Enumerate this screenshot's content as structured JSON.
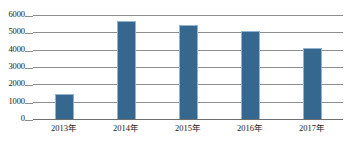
{
  "chart_data": {
    "type": "bar",
    "title": "",
    "subtitle": "",
    "xlabel": "",
    "ylabel": "",
    "categories": [
      "2013年",
      "2014年",
      "2015年",
      "2016年",
      "2017年"
    ],
    "values": [
      1450,
      5650,
      5450,
      5100,
      4100
    ],
    "ylim": [
      0,
      6000
    ],
    "ytick_labels": [
      "0",
      "1000",
      "2000",
      "3000",
      "4000",
      "5000",
      "6000"
    ],
    "ytick_values": [
      0,
      1000,
      2000,
      3000,
      4000,
      5000,
      6000
    ],
    "grid": true,
    "legend": false,
    "legend_position": "none",
    "bar_color": "#36688f",
    "bar_border_color": "#93b4cd",
    "gridline_color": "#8e8e8e",
    "axis_color": "#6f6f6f",
    "background_color": "#ffffff"
  }
}
